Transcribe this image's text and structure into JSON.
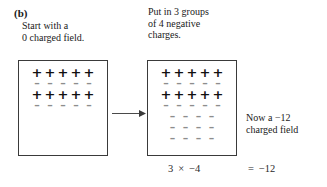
{
  "panel": {
    "label": "(b)"
  },
  "captions": {
    "start": "Start with a\n0 charged field.",
    "operation": "Put in 3 groups\nof 4 negative\ncharges.",
    "result": "Now a −12\ncharged field"
  },
  "diagram": {
    "type": "integer-chip-model",
    "start_box": {
      "name": "starting charged field",
      "net_charge": 0,
      "rows": [
        {
          "sign": "+",
          "count": 5
        },
        {
          "sign": "−",
          "count": 5
        },
        {
          "sign": "+",
          "count": 5
        },
        {
          "sign": "−",
          "count": 5
        }
      ]
    },
    "result_box": {
      "name": "resulting charged field",
      "net_charge": -12,
      "rows": [
        {
          "sign": "+",
          "count": 5
        },
        {
          "sign": "−",
          "count": 5
        },
        {
          "sign": "+",
          "count": 5
        },
        {
          "sign": "−",
          "count": 5
        },
        {
          "sign": "−",
          "count": 4
        },
        {
          "sign": "−",
          "count": 4
        },
        {
          "sign": "−",
          "count": 4
        }
      ]
    },
    "arrow": "right-arrow"
  },
  "equation": {
    "left_operand": "3",
    "operator": "×",
    "right_operand": "−4",
    "equals": "=",
    "result": "−12",
    "expression_text": "3  ×  −4",
    "result_text": "=  −12"
  },
  "colors": {
    "background": "#ffffff",
    "text": "#1a1a1a",
    "box_border": "#3a3a3a",
    "plus_charge": "#111111",
    "minus_charge": "#8d8d8d",
    "arrow": "#4a4a4a"
  }
}
